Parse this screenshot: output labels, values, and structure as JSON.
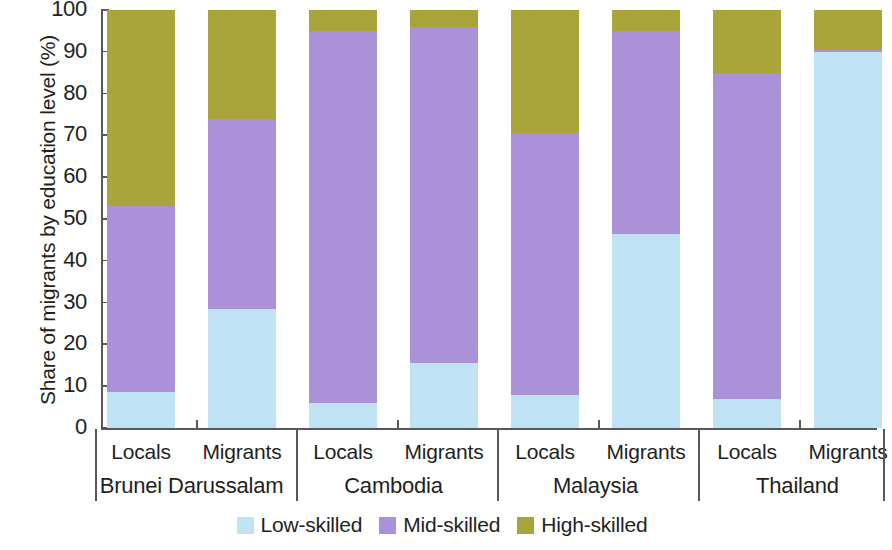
{
  "chart_data": {
    "type": "bar",
    "subtype": "stacked-bar-100",
    "title": "",
    "xlabel": "",
    "ylabel": "Share of migrants by education level (%)",
    "ylim": [
      0,
      100
    ],
    "yticks": [
      0,
      10,
      20,
      30,
      40,
      50,
      60,
      70,
      80,
      90,
      100
    ],
    "grid": false,
    "legend_position": "bottom-center",
    "groups": [
      "Brunei Darussalam",
      "Cambodia",
      "Malaysia",
      "Thailand"
    ],
    "subcategories": [
      "Locals",
      "Migrants"
    ],
    "categories": [
      "Brunei Darussalam - Locals",
      "Brunei Darussalam - Migrants",
      "Cambodia - Locals",
      "Cambodia - Migrants",
      "Malaysia - Locals",
      "Malaysia - Migrants",
      "Thailand - Locals",
      "Thailand - Migrants"
    ],
    "series": [
      {
        "name": "Low-skilled",
        "color": "#bfe3f5",
        "values": [
          8.5,
          28.5,
          6.0,
          15.5,
          8.0,
          46.5,
          7.0,
          90.0
        ]
      },
      {
        "name": "Mid-skilled",
        "color": "#ab92d8",
        "values": [
          44.5,
          45.5,
          89.0,
          80.5,
          62.5,
          48.5,
          78.0,
          0.5
        ]
      },
      {
        "name": "High-skilled",
        "color": "#a9a53a",
        "values": [
          47.0,
          26.0,
          5.0,
          4.0,
          29.5,
          5.0,
          15.0,
          9.5
        ]
      }
    ],
    "legend": [
      {
        "label": "Low-skilled",
        "color": "#bfe3f5"
      },
      {
        "label": "Mid-skilled",
        "color": "#ab92d8"
      },
      {
        "label": "High-skilled",
        "color": "#a9a53a"
      }
    ],
    "axis_color": "#58585b"
  }
}
